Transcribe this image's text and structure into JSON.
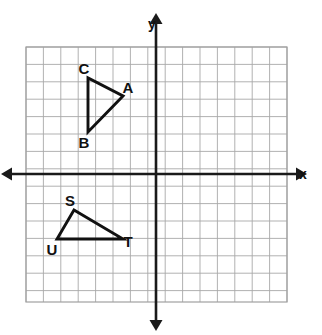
{
  "figure": {
    "background_color": "#ffffff",
    "grid_color": "#a8a8a8",
    "axis_color": "#1a1a1a",
    "shape_color": "#111111"
  },
  "axes": {
    "x_label": "x",
    "y_label": "y",
    "x_axis_pixel_y": 174,
    "y_axis_pixel_x": 156,
    "show_tick_numbers": false,
    "arrows": [
      "left",
      "right",
      "up",
      "down"
    ]
  },
  "grid": {
    "left": 26,
    "top": 47,
    "right": 287,
    "bottom": 302,
    "cell_size": 17.4,
    "columns": 15,
    "rows": 14.65
  },
  "chart_data": {
    "type": "scatter",
    "title": "",
    "xlabel": "x",
    "ylabel": "y",
    "grid": true,
    "legend": "none",
    "xlim": [
      -7.5,
      7.5
    ],
    "ylim": [
      -7.3,
      7.3
    ],
    "shapes": [
      {
        "name": "triangle-abc",
        "closed": true,
        "vertices": [
          {
            "label": "A",
            "x": -2,
            "y": 4.5,
            "px": 123,
            "py": 96,
            "label_px": 128,
            "label_py": 93
          },
          {
            "label": "B",
            "x": -4,
            "y": 2.4,
            "px": 88,
            "py": 132,
            "label_px": 84,
            "label_py": 148
          },
          {
            "label": "C",
            "x": -4,
            "y": 5.5,
            "px": 88,
            "py": 78,
            "label_px": 84,
            "label_py": 74
          }
        ]
      },
      {
        "name": "triangle-stu",
        "closed": true,
        "vertices": [
          {
            "label": "S",
            "x": -4.7,
            "y": -2,
            "px": 74,
            "py": 210,
            "label_px": 70,
            "label_py": 206
          },
          {
            "label": "T",
            "x": -2,
            "y": -3.7,
            "px": 123,
            "py": 239,
            "label_px": 128,
            "label_py": 247
          },
          {
            "label": "U",
            "x": -5.7,
            "y": -3.7,
            "px": 57,
            "py": 239,
            "label_px": 52,
            "label_py": 255
          }
        ]
      }
    ]
  }
}
